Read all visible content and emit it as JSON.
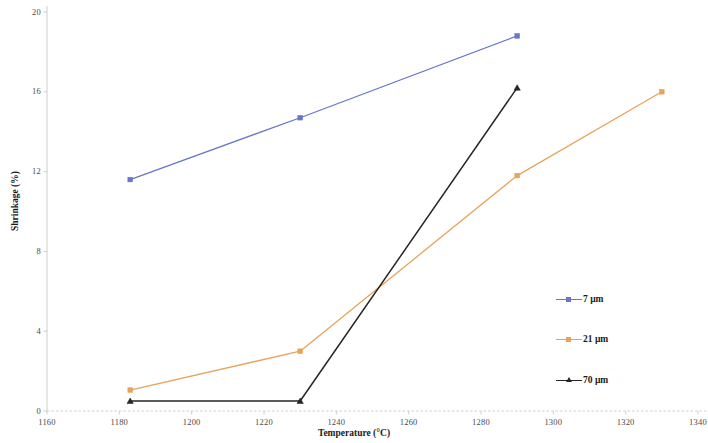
{
  "chart_data": {
    "type": "line",
    "title": "",
    "xlabel": "Temperature (°C)",
    "ylabel": "Shrinkage (%)",
    "xlim": [
      1160,
      1340
    ],
    "ylim": [
      0,
      20
    ],
    "xticks": [
      1160,
      1180,
      1200,
      1220,
      1240,
      1260,
      1280,
      1300,
      1320,
      1340
    ],
    "yticks": [
      0,
      4,
      8,
      12,
      16,
      20
    ],
    "xtick_labels": [
      "1160",
      "1180",
      "1200",
      "1220",
      "1240",
      "1260",
      "1280",
      "1300",
      "1320",
      "1340"
    ],
    "ytick_labels": [
      "0",
      "4",
      "8",
      "12",
      "16",
      "20"
    ],
    "grid": false,
    "legend_position": "right",
    "series": [
      {
        "name": "7 µm",
        "color": "#6677cc",
        "marker": "square",
        "x": [
          1183,
          1230,
          1290
        ],
        "y": [
          11.6,
          14.7,
          18.8
        ]
      },
      {
        "name": "21 µm",
        "color": "#e8a35a",
        "marker": "square",
        "x": [
          1183,
          1230,
          1290,
          1330
        ],
        "y": [
          1.05,
          3.0,
          11.8,
          16.0
        ]
      },
      {
        "name": "70 µm",
        "color": "#262626",
        "marker": "triangle",
        "x": [
          1183,
          1230,
          1290
        ],
        "y": [
          0.5,
          0.5,
          16.2
        ]
      }
    ]
  },
  "axes": {
    "x_title": "Temperature (°C)",
    "y_title": "Shrinkage (%)"
  },
  "legend": {
    "items": [
      {
        "label": "7 µm",
        "color": "#6677cc"
      },
      {
        "label": "21 µm",
        "color": "#e8a35a"
      },
      {
        "label": "70 µm",
        "color": "#262626"
      }
    ]
  }
}
